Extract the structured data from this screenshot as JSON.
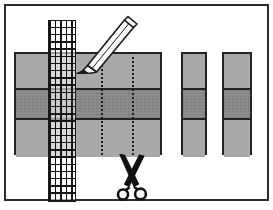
{
  "figure": {
    "frame": {
      "border_color": "#2b2b2b",
      "background": "#ffffff"
    },
    "colors": {
      "band_light": "#a9a9a9",
      "band_dark": "#8d8d8d",
      "outline": "#232323",
      "cut_line": "#1d1d1d",
      "grid_line": "#151515",
      "pencil_body": "#ffffff",
      "pencil_tip": "#1a1a1a",
      "scissors": "#111111"
    },
    "elements": [
      {
        "name": "main-sheet",
        "label": "Main banded sheet",
        "bands": [
          "light",
          "dark",
          "light"
        ],
        "band_count": 3
      },
      {
        "name": "ruler-strip",
        "label": "Gridded measuring strip",
        "columns": 5,
        "rows": 25
      },
      {
        "name": "cut-line-1",
        "label": "First dotted cut guide line",
        "style": "dotted"
      },
      {
        "name": "cut-line-2",
        "label": "Second dotted cut guide line",
        "style": "dotted"
      },
      {
        "name": "pencil",
        "label": "Pencil marking the guide line",
        "points": "down-left"
      },
      {
        "name": "scissors",
        "label": "Scissors cutting along the guide line"
      },
      {
        "name": "strip-a",
        "label": "First cut result strip",
        "bands": [
          "light",
          "dark",
          "light"
        ],
        "band_count": 3
      },
      {
        "name": "strip-b",
        "label": "Second cut result strip",
        "bands": [
          "light",
          "dark",
          "light"
        ],
        "band_count": 3
      }
    ],
    "icons": {
      "pencil": "pencil-icon",
      "scissors": "scissors-icon"
    }
  }
}
